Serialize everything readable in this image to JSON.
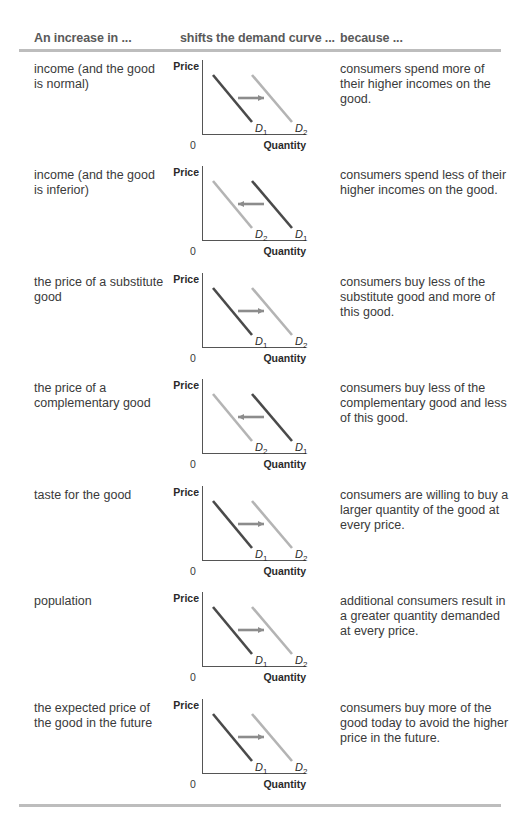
{
  "table": {
    "headers": [
      "An increase in ...",
      "shifts the demand curve ...",
      "because ..."
    ],
    "chart_labels": {
      "y_axis": "Price",
      "x_axis": "Quantity",
      "origin": "0"
    },
    "colors": {
      "d1": "#4a4a4a",
      "d2": "#b4b4b4",
      "arrow": "#8c8c8c",
      "axis": "#555555",
      "rule": "#bdbdbd"
    },
    "rows": [
      {
        "factor": "income (and the good is normal)",
        "shift": "right",
        "left_curve": "D1",
        "right_curve": "D2",
        "reason": "consumers spend more of their higher incomes on the good."
      },
      {
        "factor": "income (and the good is inferior)",
        "shift": "left",
        "left_curve": "D2",
        "right_curve": "D1",
        "reason": "consumers spend less of their higher incomes on the good."
      },
      {
        "factor": "the price of a substitute good",
        "shift": "right",
        "left_curve": "D1",
        "right_curve": "D2",
        "reason": "consumers buy less of the substitute good and more of this good."
      },
      {
        "factor": "the price of a complementary good",
        "shift": "left",
        "left_curve": "D2",
        "right_curve": "D1",
        "reason": "consumers buy less of the complementary good and less of this good."
      },
      {
        "factor": "taste for the good",
        "shift": "right",
        "left_curve": "D1",
        "right_curve": "D2",
        "reason": "consumers are willing to buy a larger quantity of the good at every price."
      },
      {
        "factor": "population",
        "shift": "right",
        "left_curve": "D1",
        "right_curve": "D2",
        "reason": "additional consumers result in a greater quantity demanded at every price."
      },
      {
        "factor": "the expected price of the good in the future",
        "shift": "right",
        "left_curve": "D1",
        "right_curve": "D2",
        "reason": "consumers buy more of the good today to avoid the higher price in the future."
      }
    ]
  }
}
